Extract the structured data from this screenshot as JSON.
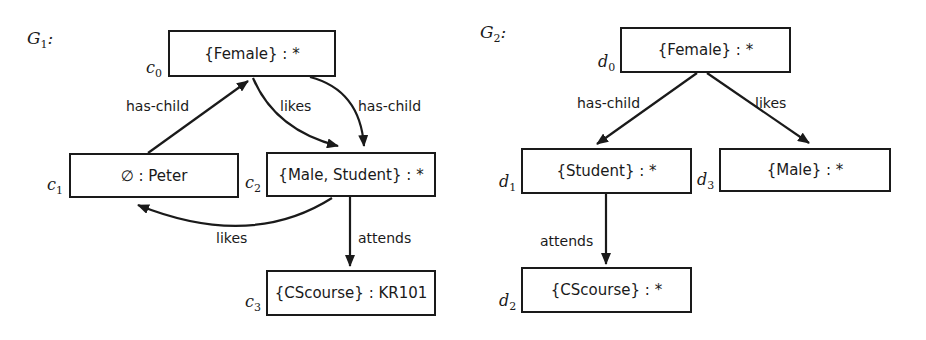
{
  "graphs": [
    {
      "title": "G",
      "title_sub": "1",
      "title_suffix": ":",
      "nodes": [
        {
          "id": "c",
          "sub": "0",
          "label": "{Female} : *"
        },
        {
          "id": "c",
          "sub": "1",
          "label": "∅ : Peter"
        },
        {
          "id": "c",
          "sub": "2",
          "label": "{Male, Student} : *"
        },
        {
          "id": "c",
          "sub": "3",
          "label": "{CScourse} : KR101"
        }
      ],
      "edges": [
        {
          "from": "c1",
          "to": "c0",
          "label": "has-child"
        },
        {
          "from": "c0",
          "to": "c2",
          "label": "likes"
        },
        {
          "from": "c0",
          "to": "c2",
          "label": "has-child"
        },
        {
          "from": "c2",
          "to": "c1",
          "label": "likes"
        },
        {
          "from": "c2",
          "to": "c3",
          "label": "attends"
        }
      ]
    },
    {
      "title": "G",
      "title_sub": "2",
      "title_suffix": ":",
      "nodes": [
        {
          "id": "d",
          "sub": "0",
          "label": "{Female} : *"
        },
        {
          "id": "d",
          "sub": "1",
          "label": "{Student} : *"
        },
        {
          "id": "d",
          "sub": "2",
          "label": "{CScourse} : *"
        },
        {
          "id": "d",
          "sub": "3",
          "label": "{Male} : *"
        }
      ],
      "edges": [
        {
          "from": "d0",
          "to": "d1",
          "label": "has-child"
        },
        {
          "from": "d0",
          "to": "d3",
          "label": "likes"
        },
        {
          "from": "d1",
          "to": "d2",
          "label": "attends"
        }
      ]
    }
  ]
}
